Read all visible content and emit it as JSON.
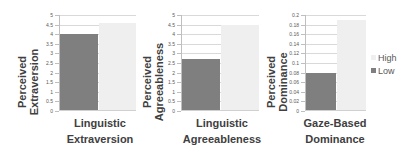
{
  "chart_data": [
    {
      "type": "bar",
      "title": "",
      "xlabel": "Linguistic Extraversion",
      "ylabel": "Perceived Extraversion",
      "categories": [
        "Linguistic Extraversion"
      ],
      "series": [
        {
          "name": "Low",
          "values": [
            4.0
          ],
          "color": "#7f7f7f"
        },
        {
          "name": "High",
          "values": [
            4.6
          ],
          "color": "#efefef"
        }
      ],
      "ylim": [
        0,
        5
      ],
      "yticks": [
        "0",
        "0.5",
        "1",
        "1.5",
        "2",
        "2.5",
        "3",
        "3.5",
        "4",
        "4.5",
        "5"
      ],
      "grid": true
    },
    {
      "type": "bar",
      "title": "",
      "xlabel": "Linguistic Agreeableness",
      "ylabel": "Perceived Agreeableness",
      "categories": [
        "Linguistic Agreeableness"
      ],
      "series": [
        {
          "name": "Low",
          "values": [
            2.7
          ],
          "color": "#7f7f7f"
        },
        {
          "name": "High",
          "values": [
            4.5
          ],
          "color": "#efefef"
        }
      ],
      "ylim": [
        0,
        5
      ],
      "yticks": [
        "0",
        "0.5",
        "1",
        "1.5",
        "2",
        "2.5",
        "3",
        "3.5",
        "4",
        "4.5",
        "5"
      ],
      "grid": true
    },
    {
      "type": "bar",
      "title": "",
      "xlabel": "Gaze-Based Dominance",
      "ylabel": "Perceived Dominance",
      "categories": [
        "Gaze-Based Dominance"
      ],
      "series": [
        {
          "name": "Low",
          "values": [
            0.08
          ],
          "color": "#7f7f7f"
        },
        {
          "name": "High",
          "values": [
            0.19
          ],
          "color": "#efefef"
        }
      ],
      "ylim": [
        0,
        0.2
      ],
      "yticks": [
        "0",
        "0.02",
        "0.04",
        "0.06",
        "0.08",
        "0.1",
        "0.12",
        "0.14",
        "0.16",
        "0.18",
        "0.2"
      ],
      "grid": true
    }
  ],
  "charts": [
    {
      "ytitle": [
        "Perceived",
        "Extraversion"
      ],
      "xtitle": [
        "Linguistic",
        "Extraversion"
      ]
    },
    {
      "ytitle": [
        "Perceived",
        "Agreeableness"
      ],
      "xtitle": [
        "Linguistic",
        "Agreeableness"
      ]
    },
    {
      "ytitle": [
        "Perceived",
        "Dominance"
      ],
      "xtitle": [
        "Gaze-Based",
        "Dominance"
      ]
    }
  ],
  "legend": {
    "position": "right",
    "items": [
      {
        "label": "High",
        "color": "#efefef"
      },
      {
        "label": "Low",
        "color": "#7f7f7f"
      }
    ]
  }
}
